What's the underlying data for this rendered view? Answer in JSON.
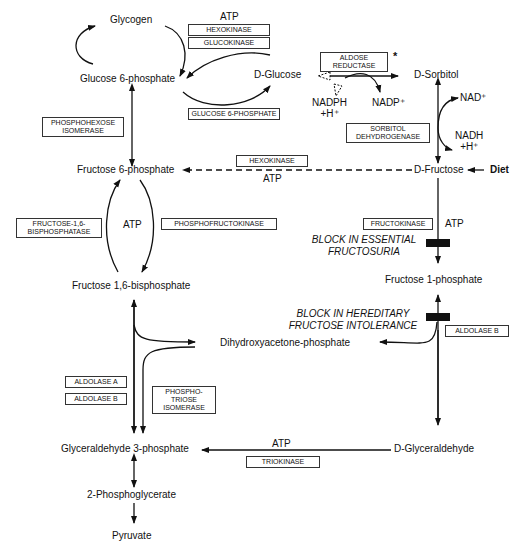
{
  "diagram": {
    "metabolites": {
      "glycogen": "Glycogen",
      "glucose_6_phosphate": "Glucose 6-phosphate",
      "d_glucose": "D-Glucose",
      "d_sorbitol": "D-Sorbitol",
      "fructose_6_phosphate": "Fructose 6-phosphate",
      "d_fructose": "D-Fructose",
      "diet": "Diet",
      "fructose_1_6_bisphosphate": "Fructose 1,6-bisphosphate",
      "fructose_1_phosphate": "Fructose 1-phosphate",
      "dihydroxyacetone_phosphate": "Dihydroxyacetone-phosphate",
      "glyceraldehyde_3_phosphate": "Glyceraldehyde 3-phosphate",
      "d_glyceraldehyde": "D-Glyceraldehyde",
      "phosphoglycerate_2": "2-Phosphoglycerate",
      "pyruvate": "Pyruvate"
    },
    "enzymes": {
      "hexokinase_top": "HEXOKINASE",
      "glucokinase": "GLUCOKINASE",
      "glucose_6_phosphatase": "GLUCOSE 6-PHOSPHATE",
      "aldose_reductase": "ALDOSE\nREDUCTASE",
      "phosphohexose_isomerase": "PHOSPHOHEXOSE\nISOMERASE",
      "sorbitol_dehydrogenase": "SORBITOL\nDEHYDROGENASE",
      "hexokinase_mid": "HEXOKINASE",
      "fructose_1_6_bisphosphatase": "FRUCTOSE-1,6-\nBISPHOSPHATASE",
      "phosphofructokinase": "PHOSPHOFRUCTOKINASE",
      "fructokinase": "FRUCTOKINASE",
      "aldolase_b_right": "ALDOLASE B",
      "aldolase_a": "ALDOLASE A",
      "aldolase_b_left": "ALDOLASE B",
      "phosphotriose_isomerase": "PHOSPHO-\nTRIOSE\nISOMERASE",
      "triokinase": "TRIOKINASE"
    },
    "cofactors": {
      "atp_top": "ATP",
      "nadph": "NADPH\n+H⁺",
      "nadp": "NADP⁺",
      "nad": "NAD⁺",
      "nadh": "NADH\n+H⁺",
      "atp_hexokinase": "ATP",
      "atp_pfk": "ATP",
      "atp_fructokinase": "ATP",
      "atp_triokinase": "ATP"
    },
    "annotations": {
      "aldose_star": "*",
      "block_essential": "BLOCK IN ESSENTIAL\nFRUCTOSURIA",
      "block_hereditary": "BLOCK IN HEREDITARY\nFRUCTOSE INTOLERANCE"
    },
    "colors": {
      "line": "#111111",
      "block_bar": "#111111",
      "background": "#ffffff"
    }
  }
}
